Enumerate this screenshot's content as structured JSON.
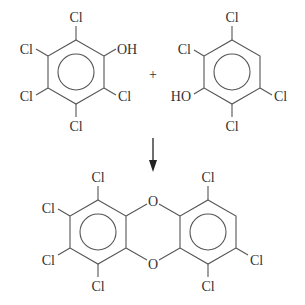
{
  "diagram": {
    "reactant_1": {
      "name": "2,3,4,5,6-pentachlorophenol",
      "substituents": [
        "Cl",
        "Cl",
        "Cl",
        "Cl",
        "Cl",
        "OH"
      ],
      "labels": {
        "top": "Cl",
        "upper_left": "Cl",
        "lower_left": "Cl",
        "bottom": "Cl",
        "lower_right": "Cl",
        "upper_right": "OH"
      }
    },
    "plus": "+",
    "reactant_2": {
      "name": "2,3,5,6-tetrachlorophenol",
      "labels": {
        "top": "Cl",
        "upper_left": "Cl",
        "lower_left": "HO",
        "bottom": "Cl",
        "lower_right": "Cl"
      }
    },
    "arrow": "reaction-arrow-down",
    "product": {
      "name": "heptachlorodibenzo-p-dioxin",
      "oxygen_top": "O",
      "oxygen_bottom": "O",
      "left_ring_labels": {
        "top": "Cl",
        "upper_left": "Cl",
        "lower_left": "Cl",
        "bottom": "Cl"
      },
      "right_ring_labels": {
        "top": "Cl",
        "lower_right": "Cl",
        "bottom": "Cl"
      }
    }
  }
}
